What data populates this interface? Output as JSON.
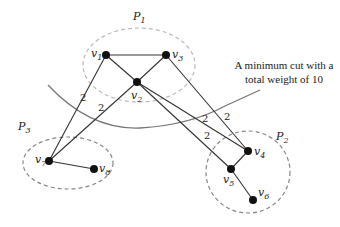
{
  "diagram": {
    "type": "graph-partition",
    "annotation": {
      "line1": "A minimum cut with a",
      "line2": "total weight of 10"
    },
    "partitions": [
      {
        "id": "P1",
        "label": "P",
        "sub": "1"
      },
      {
        "id": "P2",
        "label": "P",
        "sub": "2"
      },
      {
        "id": "P3",
        "label": "P",
        "sub": "3"
      }
    ],
    "nodes": [
      {
        "id": "v1",
        "label": "v",
        "sub": "1"
      },
      {
        "id": "v2",
        "label": "v",
        "sub": "2"
      },
      {
        "id": "v3",
        "label": "v",
        "sub": "3"
      },
      {
        "id": "v4",
        "label": "v",
        "sub": "4"
      },
      {
        "id": "v5",
        "label": "v",
        "sub": "5"
      },
      {
        "id": "v6",
        "label": "v",
        "sub": "6"
      },
      {
        "id": "v7",
        "label": "v",
        "sub": "7"
      },
      {
        "id": "v8",
        "label": "v",
        "sub": "8"
      }
    ],
    "edges": [
      {
        "from": "v1",
        "to": "v3",
        "weight": ""
      },
      {
        "from": "v1",
        "to": "v2",
        "weight": ""
      },
      {
        "from": "v2",
        "to": "v3",
        "weight": ""
      },
      {
        "from": "v1",
        "to": "v7",
        "weight": "2"
      },
      {
        "from": "v2",
        "to": "v7",
        "weight": "2"
      },
      {
        "from": "v2",
        "to": "v4",
        "weight": "2"
      },
      {
        "from": "v2",
        "to": "v5",
        "weight": "2"
      },
      {
        "from": "v3",
        "to": "v4",
        "weight": "2"
      },
      {
        "from": "v7",
        "to": "v8",
        "weight": ""
      },
      {
        "from": "v4",
        "to": "v5",
        "weight": ""
      },
      {
        "from": "v5",
        "to": "v6",
        "weight": ""
      }
    ],
    "colors": {
      "node": "#111111",
      "edge": "#333333",
      "partition_outline": "#999999",
      "cut_line": "#666666"
    }
  }
}
